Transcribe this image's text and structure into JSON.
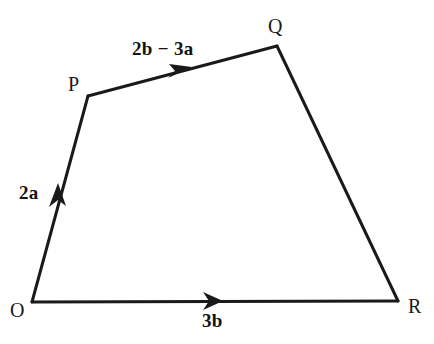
{
  "figure": {
    "name": "vector-quadrilateral-diagram",
    "background_color": "#ffffff",
    "stroke_color": "#1a1a1a",
    "stroke_width": 3
  },
  "vertices": [
    {
      "id": "O",
      "label": "O",
      "x": 32,
      "y": 302
    },
    {
      "id": "P",
      "label": "P",
      "x": 88,
      "y": 96
    },
    {
      "id": "Q",
      "label": "Q",
      "x": 277,
      "y": 46
    },
    {
      "id": "R",
      "label": "R",
      "x": 398,
      "y": 301
    }
  ],
  "edges": [
    {
      "id": "OP",
      "from": "O",
      "to": "P",
      "arrow": true,
      "arrow_at": {
        "x": 58,
        "y": 196
      }
    },
    {
      "id": "PQ",
      "from": "P",
      "to": "Q",
      "arrow": true,
      "arrow_at": {
        "x": 178,
        "y": 71
      }
    },
    {
      "id": "QR",
      "from": "Q",
      "to": "R",
      "arrow": false,
      "arrow_at": null
    },
    {
      "id": "OR",
      "from": "O",
      "to": "R",
      "arrow": true,
      "arrow_at": {
        "x": 210,
        "y": 301
      }
    }
  ],
  "vector_labels": {
    "OP": "2a",
    "PQ": "2b − 3a",
    "OR": "3b"
  }
}
